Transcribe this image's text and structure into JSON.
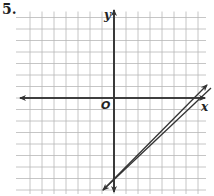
{
  "problem": {
    "number": "5."
  },
  "axes": {
    "x_label": "x",
    "y_label": "y",
    "origin_label": "O"
  },
  "colors": {
    "grid": "#b8b8b8",
    "axis": "#333333",
    "line": "#333333"
  },
  "chart_data": {
    "type": "line",
    "title": "",
    "xlabel": "x",
    "ylabel": "y",
    "xlim": [
      -7,
      7
    ],
    "ylim": [
      -8,
      7
    ],
    "grid": true,
    "series": [
      {
        "name": "line",
        "equation": "y = x - 7",
        "slope": 1,
        "y_intercept": -7,
        "x_intercept": 7,
        "points": [
          [
            -0.9,
            -7.9
          ],
          [
            0,
            -7
          ],
          [
            7,
            0
          ],
          [
            7.6,
            0.9
          ]
        ]
      }
    ]
  }
}
